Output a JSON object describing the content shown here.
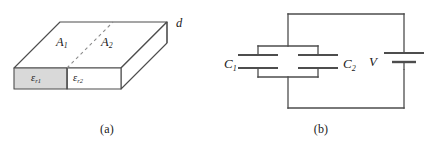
{
  "figure": {
    "panels": [
      {
        "id": "a",
        "caption": "(a)",
        "kind": "3d-slab-capacitor",
        "labels": {
          "area_1": "A",
          "area_1_sub": "1",
          "area_2": "A",
          "area_2_sub": "2",
          "thickness": "d",
          "dielectric_1": "ε",
          "dielectric_1_sub": "r1",
          "dielectric_2": "ε",
          "dielectric_2_sub": "r2"
        },
        "fills": {
          "dielectric_1_color": "#d9d9d9",
          "dielectric_2_color": "#ffffff",
          "top_face_color": "#ffffff",
          "side_face_color": "#ffffff"
        }
      },
      {
        "id": "b",
        "caption": "(b)",
        "kind": "parallel-capacitor-circuit",
        "labels": {
          "capacitor_1": "C",
          "capacitor_1_sub": "1",
          "capacitor_2": "C",
          "capacitor_2_sub": "2",
          "source": "V"
        },
        "components": [
          {
            "name": "capacitor-1",
            "type": "capacitor",
            "label": "C1"
          },
          {
            "name": "capacitor-2",
            "type": "capacitor",
            "label": "C2"
          },
          {
            "name": "voltage-source",
            "type": "battery",
            "label": "V"
          }
        ],
        "topology": "C1 parallel C2, connected across V"
      }
    ],
    "stroke_color": "#4d4d4d",
    "dash_color": "#8c8c8c",
    "background": "#ffffff"
  }
}
